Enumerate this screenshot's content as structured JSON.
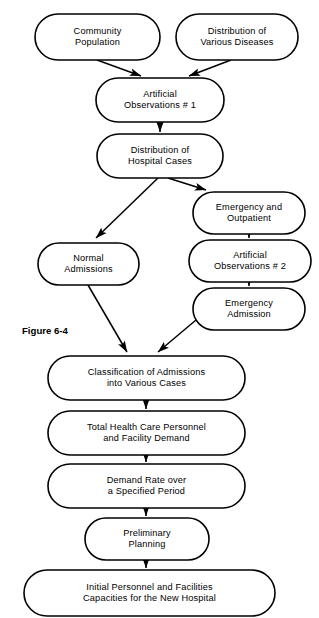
{
  "figure": {
    "caption": "Figure 6-4",
    "caption_x": 22,
    "caption_y": 331
  },
  "style": {
    "node_fill": "#ffffff",
    "node_stroke": "#000000",
    "text_color": "#000000",
    "background": "#ffffff"
  },
  "chart_data": {
    "type": "diagram",
    "title": "Figure 6-4",
    "diagram_kind": "flowchart",
    "orientation": "top-to-bottom",
    "node_shape": "rounded-rectangle (stadium)",
    "nodes": [
      {
        "id": "community-population",
        "lines": [
          "Community",
          "Population"
        ],
        "x": 35,
        "y": 14,
        "w": 125,
        "h": 46
      },
      {
        "id": "distribution-various-diseases",
        "lines": [
          "Distribution of",
          "Various Diseases"
        ],
        "x": 176,
        "y": 14,
        "w": 122,
        "h": 46
      },
      {
        "id": "artificial-observations-1",
        "lines": [
          "Artificial",
          "Observations  # 1"
        ],
        "x": 96,
        "y": 78,
        "w": 128,
        "h": 44
      },
      {
        "id": "distribution-hospital-cases",
        "lines": [
          "Distribution of",
          "Hospital Cases"
        ],
        "x": 97,
        "y": 134,
        "w": 126,
        "h": 44
      },
      {
        "id": "emergency-and-outpatient",
        "lines": [
          "Emergency and",
          "Outpatient"
        ],
        "x": 193,
        "y": 192,
        "w": 112,
        "h": 42
      },
      {
        "id": "normal-admissions",
        "lines": [
          "Normal",
          "Admissions"
        ],
        "x": 38,
        "y": 243,
        "w": 101,
        "h": 42
      },
      {
        "id": "artificial-observations-2",
        "lines": [
          "Artificial",
          "Observations  # 2"
        ],
        "x": 189,
        "y": 240,
        "w": 122,
        "h": 42
      },
      {
        "id": "emergency-admission",
        "lines": [
          "Emergency",
          "Admission"
        ],
        "x": 193,
        "y": 288,
        "w": 112,
        "h": 42
      },
      {
        "id": "classification-of-admissions",
        "lines": [
          "Classification of Admissions",
          "into Various Cases"
        ],
        "x": 48,
        "y": 356,
        "w": 197,
        "h": 44
      },
      {
        "id": "total-health-care-personnel",
        "lines": [
          "Total Health Care Personnel",
          "and Facility Demand"
        ],
        "x": 48,
        "y": 411,
        "w": 197,
        "h": 44
      },
      {
        "id": "demand-rate-over-period",
        "lines": [
          "Demand Rate over",
          "a Specified Period"
        ],
        "x": 48,
        "y": 464,
        "w": 197,
        "h": 44
      },
      {
        "id": "preliminary-planning",
        "lines": [
          "Preliminary",
          "Planning"
        ],
        "x": 85,
        "y": 518,
        "w": 124,
        "h": 42
      },
      {
        "id": "initial-personnel-facilities",
        "lines": [
          "Initial Personnel and Facilities",
          "Capacities for the New Hospital"
        ],
        "x": 24,
        "y": 570,
        "w": 251,
        "h": 46
      }
    ],
    "edges": [
      {
        "id": "edge-community-to-ao1",
        "from": "community-population",
        "to": "artificial-observations-1",
        "x1": 97,
        "y1": 60,
        "x2": 141,
        "y2": 76,
        "arrow": true
      },
      {
        "id": "edge-diseases-to-ao1",
        "from": "distribution-various-diseases",
        "to": "artificial-observations-1",
        "x1": 231,
        "y1": 60,
        "x2": 189,
        "y2": 76,
        "arrow": true
      },
      {
        "id": "edge-ao1-to-hospital-cases",
        "from": "artificial-observations-1",
        "to": "distribution-hospital-cases",
        "x1": 160,
        "y1": 122,
        "x2": 160,
        "y2": 132,
        "arrow": true
      },
      {
        "id": "edge-hospital-cases-to-normal",
        "from": "distribution-hospital-cases",
        "to": "normal-admissions",
        "x1": 158,
        "y1": 178,
        "x2": 96,
        "y2": 238,
        "arrow": true
      },
      {
        "id": "edge-hospital-cases-to-emergency",
        "from": "distribution-hospital-cases",
        "to": "emergency-and-outpatient",
        "x1": 168,
        "y1": 178,
        "x2": 206,
        "y2": 190,
        "arrow": true
      },
      {
        "id": "edge-emergency-to-ao2",
        "from": "emergency-and-outpatient",
        "to": "artificial-observations-2",
        "x1": 249,
        "y1": 234,
        "x2": 249,
        "y2": 238,
        "arrow": true
      },
      {
        "id": "edge-ao2-to-emergency-admission",
        "from": "artificial-observations-2",
        "to": "emergency-admission",
        "x1": 249,
        "y1": 282,
        "x2": 249,
        "y2": 286,
        "arrow": true
      },
      {
        "id": "edge-normal-to-classification",
        "from": "normal-admissions",
        "to": "classification-of-admissions",
        "x1": 88,
        "y1": 285,
        "x2": 127,
        "y2": 352,
        "arrow": true
      },
      {
        "id": "edge-emergency-admission-to-classification",
        "from": "emergency-admission",
        "to": "classification-of-admissions",
        "x1": 196,
        "y1": 320,
        "x2": 158,
        "y2": 352,
        "arrow": true
      },
      {
        "id": "edge-classification-to-total",
        "from": "classification-of-admissions",
        "to": "total-health-care-personnel",
        "x1": 146,
        "y1": 400,
        "x2": 146,
        "y2": 409,
        "arrow": true
      },
      {
        "id": "edge-total-to-demand-rate",
        "from": "total-health-care-personnel",
        "to": "demand-rate-over-period",
        "x1": 146,
        "y1": 455,
        "x2": 146,
        "y2": 462,
        "arrow": true
      },
      {
        "id": "edge-demand-rate-to-preliminary",
        "from": "demand-rate-over-period",
        "to": "preliminary-planning",
        "x1": 146,
        "y1": 508,
        "x2": 146,
        "y2": 516,
        "arrow": true
      },
      {
        "id": "edge-preliminary-to-initial",
        "from": "preliminary-planning",
        "to": "initial-personnel-facilities",
        "x1": 146,
        "y1": 560,
        "x2": 146,
        "y2": 568,
        "arrow": true
      }
    ]
  }
}
